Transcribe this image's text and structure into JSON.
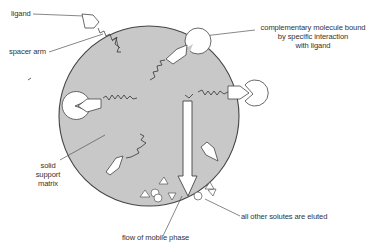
{
  "diagram": {
    "labels": {
      "ligand": "ligand",
      "spacer_arm": "spacer arm",
      "complementary_line1": "complementary molecule bound",
      "complementary_line2": "by specific interaction",
      "complementary_line3": "with ligand",
      "matrix_line1": "solid",
      "matrix_line2": "support",
      "matrix_line3": "matrix",
      "flow": "flow of mobile phase",
      "eluted": "all other solutes are eluted"
    },
    "colors": {
      "matrix_fill": "#c8c8c8",
      "stroke": "#444444",
      "leader": "#555555",
      "background": "#ffffff"
    }
  }
}
